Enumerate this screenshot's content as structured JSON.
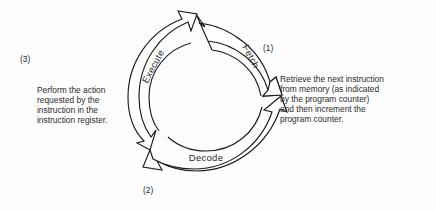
{
  "figure": {
    "kind": "cycle-diagram",
    "background_color": "#fdfdfd",
    "stroke_color": "#1c1c1c",
    "text_color": "#2b2b2b"
  },
  "cycle": {
    "phases": [
      {
        "id": "fetch",
        "label": "Fetch",
        "step": "(1)"
      },
      {
        "id": "decode",
        "label": "Decode",
        "step": "(2)"
      },
      {
        "id": "execute",
        "label": "Execute",
        "step": "(3)"
      }
    ]
  },
  "callouts": {
    "fetch": {
      "number": "(1)",
      "text": "Retrieve the next instruction\nfrom memory (as indicated\nby the program counter)\nand then increment the\nprogram counter."
    },
    "decode": {
      "number": "(2)",
      "text": "Decode the bit pattern\nin the instruction register."
    },
    "execute": {
      "number": "(3)",
      "text": "Perform the action\nrequested by the\ninstruction in the\ninstruction register."
    }
  }
}
